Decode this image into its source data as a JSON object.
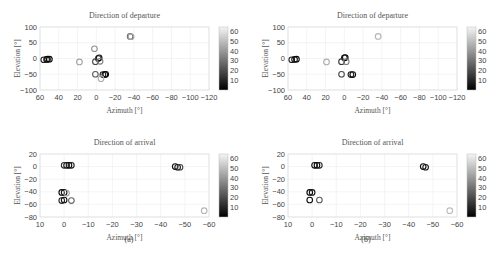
{
  "figure": {
    "sublabels": [
      "(a)",
      "(b)"
    ],
    "colorbar": {
      "ticks": [
        "10",
        "20",
        "30",
        "40",
        "50",
        "60"
      ],
      "min": 0,
      "max": 65,
      "colormap": "gray"
    }
  },
  "chart_data": [
    {
      "id": "a-departure",
      "type": "scatter",
      "title": "Direction of departure",
      "xlabel": "Azimuth [°]",
      "ylabel": "Elevation [°]",
      "xlim": [
        60,
        -120
      ],
      "ylim": [
        -100,
        100
      ],
      "xticks": [
        "60",
        "40",
        "20",
        "0",
        "−20",
        "−40",
        "−60",
        "−80",
        "−100",
        "−120"
      ],
      "yticks": [
        "100",
        "50",
        "0",
        "−50",
        "−100"
      ],
      "grid": true,
      "colorbar": true,
      "points": [
        {
          "x": 56,
          "y": -4,
          "c": 10
        },
        {
          "x": 53,
          "y": -3,
          "c": 8
        },
        {
          "x": 52,
          "y": -2,
          "c": 4
        },
        {
          "x": 50,
          "y": -2,
          "c": 2
        },
        {
          "x": 18,
          "y": -11,
          "c": 45
        },
        {
          "x": 2,
          "y": 31,
          "c": 40
        },
        {
          "x": -2,
          "y": 0,
          "c": 15
        },
        {
          "x": -3,
          "y": 2,
          "c": 5
        },
        {
          "x": 1,
          "y": -10,
          "c": 20
        },
        {
          "x": -4,
          "y": -9,
          "c": 35
        },
        {
          "x": 1,
          "y": -50,
          "c": 25
        },
        {
          "x": -7,
          "y": -51,
          "c": 10
        },
        {
          "x": -9,
          "y": -51,
          "c": 5
        },
        {
          "x": -10,
          "y": -50,
          "c": 2
        },
        {
          "x": -5,
          "y": -64,
          "c": 48
        },
        {
          "x": -36,
          "y": 70,
          "c": 30
        },
        {
          "x": -37,
          "y": 69,
          "c": 45
        }
      ]
    },
    {
      "id": "a-arrival",
      "type": "scatter",
      "title": "Direction of arrival",
      "xlabel": "Azimuth [°]",
      "ylabel": "Elevation [°]",
      "xlim": [
        10,
        -60
      ],
      "ylim": [
        -80,
        20
      ],
      "xticks": [
        "10",
        "0",
        "−10",
        "−20",
        "−30",
        "−40",
        "−50",
        "−60"
      ],
      "yticks": [
        "20",
        "0",
        "−20",
        "−40",
        "−60",
        "−80"
      ],
      "grid": true,
      "colorbar": true,
      "points": [
        {
          "x": -1,
          "y": 2,
          "c": 5
        },
        {
          "x": -2,
          "y": 2,
          "c": 2
        },
        {
          "x": -3,
          "y": 2,
          "c": 8
        },
        {
          "x": 0,
          "y": 2,
          "c": 12
        },
        {
          "x": 1,
          "y": -41,
          "c": 2
        },
        {
          "x": 0,
          "y": -41,
          "c": 6
        },
        {
          "x": -1,
          "y": -42,
          "c": 45
        },
        {
          "x": 1,
          "y": -54,
          "c": 10
        },
        {
          "x": 0,
          "y": -53,
          "c": 4
        },
        {
          "x": -3,
          "y": -54,
          "c": 28
        },
        {
          "x": -46,
          "y": 0,
          "c": 3
        },
        {
          "x": -47,
          "y": -1,
          "c": 6
        },
        {
          "x": -48,
          "y": -1,
          "c": 18
        },
        {
          "x": -58,
          "y": -70,
          "c": 50
        }
      ]
    },
    {
      "id": "b-departure",
      "type": "scatter",
      "title": "Direction of departure",
      "xlabel": "Azimuth [°]",
      "ylabel": "Elevation [°]",
      "xlim": [
        60,
        -120
      ],
      "ylim": [
        -100,
        100
      ],
      "xticks": [
        "60",
        "40",
        "20",
        "0",
        "−20",
        "−40",
        "−60",
        "−80",
        "−100",
        "−120"
      ],
      "yticks": [
        "100",
        "50",
        "0",
        "−50",
        "−100"
      ],
      "grid": true,
      "colorbar": true,
      "points": [
        {
          "x": 56,
          "y": -4,
          "c": 10
        },
        {
          "x": 53,
          "y": -3,
          "c": 5
        },
        {
          "x": 51,
          "y": -2,
          "c": 2
        },
        {
          "x": 19,
          "y": -11,
          "c": 48
        },
        {
          "x": 0,
          "y": 2,
          "c": 8
        },
        {
          "x": -1,
          "y": 3,
          "c": 2
        },
        {
          "x": 3,
          "y": -10,
          "c": 15
        },
        {
          "x": -2,
          "y": -10,
          "c": 35
        },
        {
          "x": 3,
          "y": -50,
          "c": 20
        },
        {
          "x": -7,
          "y": -51,
          "c": 8
        },
        {
          "x": -9,
          "y": -51,
          "c": 3
        },
        {
          "x": -36,
          "y": 70,
          "c": 50
        }
      ]
    },
    {
      "id": "b-arrival",
      "type": "scatter",
      "title": "Direction of arrival",
      "xlabel": "Azimuth [°]",
      "ylabel": "Elevation [°]",
      "xlim": [
        10,
        -60
      ],
      "ylim": [
        -80,
        20
      ],
      "xticks": [
        "10",
        "0",
        "−10",
        "−20",
        "−30",
        "−40",
        "−50",
        "−60"
      ],
      "yticks": [
        "20",
        "0",
        "−20",
        "−40",
        "−60",
        "−80"
      ],
      "grid": true,
      "colorbar": true,
      "points": [
        {
          "x": -1,
          "y": 2,
          "c": 4
        },
        {
          "x": -2,
          "y": 2,
          "c": 2
        },
        {
          "x": -3,
          "y": 2,
          "c": 10
        },
        {
          "x": 1,
          "y": -41,
          "c": 2
        },
        {
          "x": 0,
          "y": -41,
          "c": 6
        },
        {
          "x": 1,
          "y": -53,
          "c": 4
        },
        {
          "x": -3,
          "y": -53,
          "c": 25
        },
        {
          "x": -46,
          "y": 0,
          "c": 3
        },
        {
          "x": -47,
          "y": -1,
          "c": 7
        },
        {
          "x": -57,
          "y": -70,
          "c": 52
        }
      ]
    }
  ]
}
